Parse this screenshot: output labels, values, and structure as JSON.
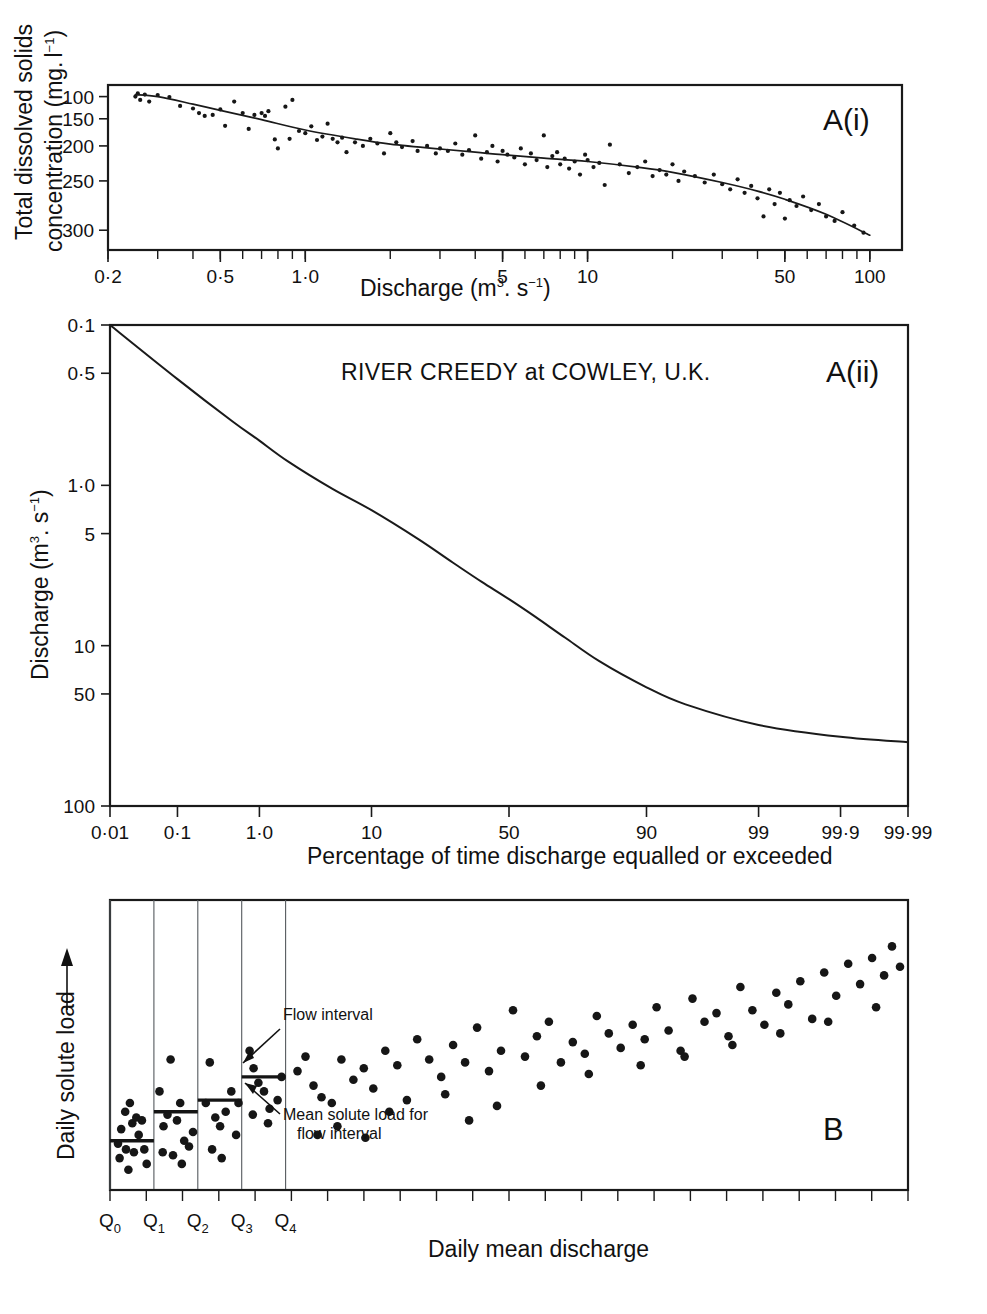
{
  "figure": {
    "background": "#ffffff",
    "ink_color": "#141414"
  },
  "panel_a_i": {
    "letter": "A(i)",
    "ylabel_line1": "Total dissolved solids",
    "ylabel_line2": "concentration (mg.",
    "ylabel_unit_l": "l",
    "ylabel_unit_exp": "−1",
    "ylabel_close": ")",
    "xlabel_main": "Discharge (m",
    "xlabel_sup3": "3",
    "xlabel_mid": ". s",
    "xlabel_supm1": "−1",
    "xlabel_close": ")",
    "y_ticks": [
      "300",
      "250",
      "200",
      "150",
      "100"
    ],
    "x_ticks": [
      "0·2",
      "0·5",
      "1·0",
      "5",
      "10",
      "50",
      "100"
    ]
  },
  "panel_a_ii": {
    "letter": "A(ii)",
    "title": "RIVER CREEDY at COWLEY, U.K.",
    "ylabel_main": "Discharge (m",
    "ylabel_sup3": "3",
    "ylabel_mid": ". s",
    "ylabel_supm1": "−1",
    "ylabel_close": ")",
    "xlabel": "Percentage of time discharge equalled or exceeded",
    "y_ticks": [
      "100",
      "50",
      "10",
      "5",
      "1·0",
      "0·5",
      "0·1"
    ],
    "x_ticks": [
      "0·01",
      "0·1",
      "1·0",
      "10",
      "50",
      "90",
      "99",
      "99·9",
      "99·99"
    ]
  },
  "panel_b": {
    "letter": "B",
    "ylabel": "Daily solute load",
    "xlabel": "Daily mean discharge",
    "annotation_flow_interval": "Flow interval",
    "annotation_mean_line1": "Mean solute load for",
    "annotation_mean_line2": "flow interval",
    "q_labels": [
      {
        "base": "Q",
        "sub": "0"
      },
      {
        "base": "Q",
        "sub": "1"
      },
      {
        "base": "Q",
        "sub": "2"
      },
      {
        "base": "Q",
        "sub": "3"
      },
      {
        "base": "Q",
        "sub": "4"
      }
    ]
  },
  "chart_data": [
    {
      "id": "A(i)",
      "type": "scatter",
      "title": "",
      "xlabel": "Discharge (m3. s-1)",
      "ylabel": "Total dissolved solids concentration (mg. l-1)",
      "xscale": "log",
      "yscale": "log",
      "xlim": [
        0.2,
        130
      ],
      "ylim": [
        85,
        330
      ],
      "xticks": [
        0.2,
        0.5,
        1.0,
        5,
        10,
        50,
        100
      ],
      "yticks": [
        100,
        150,
        200,
        250,
        300
      ],
      "grid": false,
      "legend": "none",
      "fit_curve_description": "Smooth monotonic decreasing rating curve from ~305 mg/l at 0.25 m3/s to ~95 mg/l at 100 m3/s",
      "fit_curve": [
        [
          0.25,
          305
        ],
        [
          0.3,
          300
        ],
        [
          0.4,
          282
        ],
        [
          0.5,
          268
        ],
        [
          0.7,
          248
        ],
        [
          1.0,
          228
        ],
        [
          1.5,
          212
        ],
        [
          2.0,
          203
        ],
        [
          3.0,
          195
        ],
        [
          4.0,
          190
        ],
        [
          5.0,
          186
        ],
        [
          7.0,
          181
        ],
        [
          10.0,
          176
        ],
        [
          15.0,
          168
        ],
        [
          20.0,
          161
        ],
        [
          30.0,
          148
        ],
        [
          40.0,
          138
        ],
        [
          50.0,
          129
        ],
        [
          70.0,
          114
        ],
        [
          100.0,
          96
        ]
      ],
      "points": [
        [
          0.25,
          300
        ],
        [
          0.255,
          308
        ],
        [
          0.26,
          292
        ],
        [
          0.27,
          305
        ],
        [
          0.28,
          288
        ],
        [
          0.3,
          304
        ],
        [
          0.33,
          299
        ],
        [
          0.36,
          278
        ],
        [
          0.4,
          272
        ],
        [
          0.42,
          262
        ],
        [
          0.44,
          256
        ],
        [
          0.47,
          258
        ],
        [
          0.5,
          270
        ],
        [
          0.52,
          236
        ],
        [
          0.56,
          288
        ],
        [
          0.6,
          262
        ],
        [
          0.63,
          230
        ],
        [
          0.66,
          258
        ],
        [
          0.7,
          262
        ],
        [
          0.72,
          256
        ],
        [
          0.74,
          266
        ],
        [
          0.78,
          211
        ],
        [
          0.8,
          196
        ],
        [
          0.85,
          276
        ],
        [
          0.88,
          212
        ],
        [
          0.9,
          292
        ],
        [
          0.95,
          226
        ],
        [
          1.0,
          222
        ],
        [
          1.05,
          235
        ],
        [
          1.1,
          210
        ],
        [
          1.15,
          216
        ],
        [
          1.2,
          240
        ],
        [
          1.25,
          212
        ],
        [
          1.3,
          206
        ],
        [
          1.35,
          214
        ],
        [
          1.4,
          190
        ],
        [
          1.5,
          206
        ],
        [
          1.6,
          200
        ],
        [
          1.7,
          212
        ],
        [
          1.8,
          204
        ],
        [
          1.9,
          188
        ],
        [
          2.0,
          222
        ],
        [
          2.1,
          206
        ],
        [
          2.2,
          198
        ],
        [
          2.4,
          208
        ],
        [
          2.5,
          192
        ],
        [
          2.7,
          200
        ],
        [
          2.9,
          188
        ],
        [
          3.0,
          196
        ],
        [
          3.2,
          192
        ],
        [
          3.4,
          204
        ],
        [
          3.6,
          186
        ],
        [
          3.8,
          193
        ],
        [
          4.0,
          218
        ],
        [
          4.2,
          180
        ],
        [
          4.4,
          190
        ],
        [
          4.6,
          200
        ],
        [
          4.8,
          176
        ],
        [
          5.0,
          192
        ],
        [
          5.2,
          186
        ],
        [
          5.5,
          182
        ],
        [
          5.8,
          196
        ],
        [
          6.0,
          172
        ],
        [
          6.3,
          188
        ],
        [
          6.6,
          178
        ],
        [
          7.0,
          218
        ],
        [
          7.2,
          168
        ],
        [
          7.5,
          184
        ],
        [
          7.8,
          190
        ],
        [
          8.0,
          172
        ],
        [
          8.3,
          180
        ],
        [
          8.6,
          166
        ],
        [
          9.0,
          176
        ],
        [
          9.4,
          158
        ],
        [
          9.8,
          186
        ],
        [
          10.0,
          178
        ],
        [
          10.5,
          168
        ],
        [
          11.0,
          174
        ],
        [
          11.5,
          145
        ],
        [
          12.0,
          202
        ],
        [
          13.0,
          172
        ],
        [
          14.0,
          160
        ],
        [
          15.0,
          168
        ],
        [
          16.0,
          176
        ],
        [
          17.0,
          156
        ],
        [
          18.0,
          164
        ],
        [
          19.0,
          158
        ],
        [
          20.0,
          172
        ],
        [
          21.0,
          150
        ],
        [
          22.0,
          162
        ],
        [
          24.0,
          156
        ],
        [
          26.0,
          148
        ],
        [
          28.0,
          158
        ],
        [
          30.0,
          146
        ],
        [
          32.0,
          140
        ],
        [
          34.0,
          152
        ],
        [
          36.0,
          136
        ],
        [
          38.0,
          144
        ],
        [
          40.0,
          130
        ],
        [
          42.0,
          112
        ],
        [
          44.0,
          140
        ],
        [
          46.0,
          124
        ],
        [
          48.0,
          136
        ],
        [
          50.0,
          110
        ],
        [
          52.0,
          128
        ],
        [
          55.0,
          122
        ],
        [
          58.0,
          132
        ],
        [
          62.0,
          118
        ],
        [
          66.0,
          124
        ],
        [
          70.0,
          112
        ],
        [
          75.0,
          108
        ],
        [
          80.0,
          116
        ],
        [
          88.0,
          104
        ],
        [
          95.0,
          98
        ]
      ]
    },
    {
      "id": "A(ii)",
      "type": "line",
      "title": "RIVER CREEDY at COWLEY, U.K.",
      "xlabel": "Percentage of time discharge equalled or exceeded",
      "ylabel": "Discharge (m3. s-1)",
      "xscale": "probability",
      "yscale": "log",
      "ylim": [
        0.1,
        100
      ],
      "yticks": [
        0.1,
        0.5,
        1.0,
        5,
        10,
        50,
        100
      ],
      "xticks": [
        0.01,
        0.1,
        1.0,
        10,
        50,
        90,
        99,
        99.9,
        99.99
      ],
      "grid": false,
      "legend": "none",
      "description": "Flow duration curve: discharge declines from 100 m3/s at 0.01% exceedance to ~0.25 m3/s at 99.99% exceedance",
      "series": [
        {
          "name": "flow duration curve",
          "points": [
            [
              0.01,
              100
            ],
            [
              0.1,
              46
            ],
            [
              0.5,
              25
            ],
            [
              1.0,
              19
            ],
            [
              2.0,
              14
            ],
            [
              5.0,
              9.5
            ],
            [
              10.0,
              7.0
            ],
            [
              20.0,
              4.6
            ],
            [
              30.0,
              3.3
            ],
            [
              40.0,
              2.5
            ],
            [
              50.0,
              1.95
            ],
            [
              60.0,
              1.5
            ],
            [
              70.0,
              1.12
            ],
            [
              80.0,
              0.8
            ],
            [
              90.0,
              0.55
            ],
            [
              95.0,
              0.43
            ],
            [
              99.0,
              0.32
            ],
            [
              99.9,
              0.27
            ],
            [
              99.99,
              0.25
            ]
          ]
        }
      ]
    },
    {
      "id": "B",
      "type": "scatter",
      "title": "",
      "xlabel": "Daily mean discharge",
      "ylabel": "Daily solute load",
      "xscale": "linear",
      "yscale": "linear",
      "xlim": [
        0,
        100
      ],
      "ylim": [
        0,
        100
      ],
      "grid": false,
      "legend": "none",
      "description": "Rating-curve method illustration: daily solute load versus daily mean discharge with five flow-interval classes (Q0-Q4) and mean solute load for each interval",
      "flow_interval_boundaries_x": [
        0,
        5.5,
        11.0,
        16.5,
        22.0
      ],
      "flow_interval_means_y": [
        17,
        27,
        31,
        39,
        null
      ],
      "points": [
        [
          1.4,
          21
        ],
        [
          1.9,
          27
        ],
        [
          2.5,
          30
        ],
        [
          2.8,
          23
        ],
        [
          3.3,
          25
        ],
        [
          3.6,
          19
        ],
        [
          1.2,
          11
        ],
        [
          2.0,
          14
        ],
        [
          2.3,
          7
        ],
        [
          4.3,
          14
        ],
        [
          4.6,
          9
        ],
        [
          1.0,
          16
        ],
        [
          3.0,
          13
        ],
        [
          4.0,
          24
        ],
        [
          6.2,
          34
        ],
        [
          6.7,
          22
        ],
        [
          7.2,
          26
        ],
        [
          7.6,
          45
        ],
        [
          8.4,
          24
        ],
        [
          8.8,
          30
        ],
        [
          9.3,
          17
        ],
        [
          6.6,
          13
        ],
        [
          7.9,
          12
        ],
        [
          9.0,
          9
        ],
        [
          9.9,
          15
        ],
        [
          10.4,
          20
        ],
        [
          12.0,
          30
        ],
        [
          12.5,
          44
        ],
        [
          13.2,
          25
        ],
        [
          13.8,
          22
        ],
        [
          14.5,
          27
        ],
        [
          15.2,
          34
        ],
        [
          12.8,
          14
        ],
        [
          14.0,
          11
        ],
        [
          15.8,
          19
        ],
        [
          16.1,
          30
        ],
        [
          17.5,
          48
        ],
        [
          18.0,
          42
        ],
        [
          18.6,
          37
        ],
        [
          19.3,
          34
        ],
        [
          20.0,
          28
        ],
        [
          21.0,
          31
        ],
        [
          17.9,
          26
        ],
        [
          19.8,
          23
        ],
        [
          21.5,
          39
        ],
        [
          23.5,
          41
        ],
        [
          24.5,
          46
        ],
        [
          25.5,
          36
        ],
        [
          26.5,
          32
        ],
        [
          27.8,
          30
        ],
        [
          29.0,
          45
        ],
        [
          30.5,
          38
        ],
        [
          31.8,
          42
        ],
        [
          33.0,
          35
        ],
        [
          34.5,
          48
        ],
        [
          36.0,
          43
        ],
        [
          37.2,
          31
        ],
        [
          38.5,
          52
        ],
        [
          40.0,
          45
        ],
        [
          41.5,
          39
        ],
        [
          43.0,
          50
        ],
        [
          44.5,
          44
        ],
        [
          46.0,
          56
        ],
        [
          47.5,
          41
        ],
        [
          49.0,
          48
        ],
        [
          50.5,
          62
        ],
        [
          52.0,
          46
        ],
        [
          53.5,
          53
        ],
        [
          55.0,
          58
        ],
        [
          56.5,
          44
        ],
        [
          58.0,
          51
        ],
        [
          59.5,
          47
        ],
        [
          61.0,
          60
        ],
        [
          62.5,
          54
        ],
        [
          64.0,
          49
        ],
        [
          65.5,
          57
        ],
        [
          67.0,
          52
        ],
        [
          68.5,
          63
        ],
        [
          70.0,
          55
        ],
        [
          71.5,
          48
        ],
        [
          73.0,
          66
        ],
        [
          74.5,
          58
        ],
        [
          76.0,
          61
        ],
        [
          77.5,
          53
        ],
        [
          79.0,
          70
        ],
        [
          80.5,
          62
        ],
        [
          82.0,
          57
        ],
        [
          83.5,
          68
        ],
        [
          85.0,
          64
        ],
        [
          86.5,
          72
        ],
        [
          88.0,
          59
        ],
        [
          89.5,
          75
        ],
        [
          91.0,
          67
        ],
        [
          92.5,
          78
        ],
        [
          94.0,
          71
        ],
        [
          95.5,
          80
        ],
        [
          97.0,
          74
        ],
        [
          98.0,
          84
        ],
        [
          99.0,
          77
        ],
        [
          28.5,
          22
        ],
        [
          35.0,
          27
        ],
        [
          42.0,
          33
        ],
        [
          48.5,
          29
        ],
        [
          54.0,
          36
        ],
        [
          60.0,
          40
        ],
        [
          66.5,
          43
        ],
        [
          72.0,
          46
        ],
        [
          78.0,
          50
        ],
        [
          84.0,
          54
        ],
        [
          90.0,
          58
        ],
        [
          96.0,
          63
        ],
        [
          32.0,
          18
        ],
        [
          45.0,
          24
        ],
        [
          26.0,
          19
        ]
      ]
    }
  ]
}
